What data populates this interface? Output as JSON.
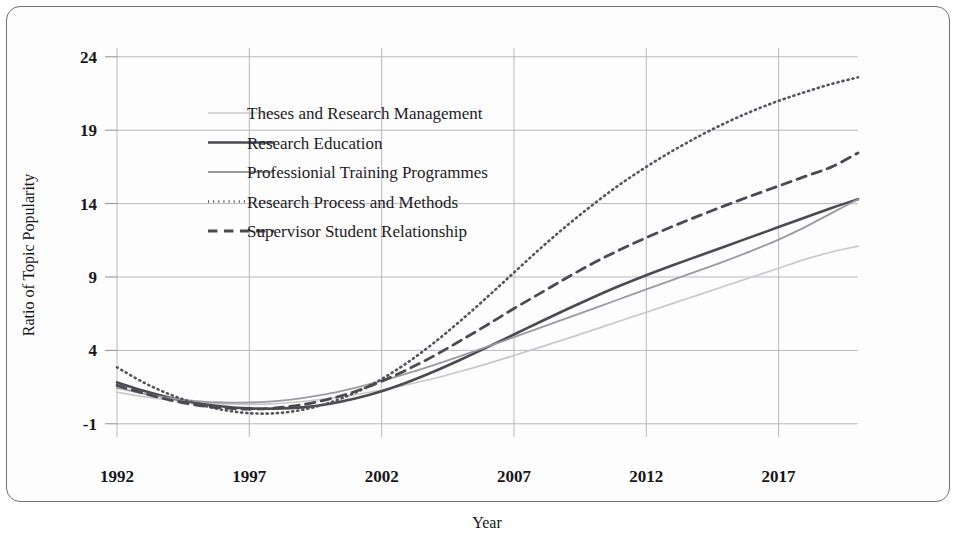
{
  "figure": {
    "frame_border_color": "#6f6f72",
    "background_color": "#fdfdfd",
    "grid_color": "#b9b9bd"
  },
  "chart_data": {
    "type": "line",
    "title": "",
    "subtitle": "",
    "xlabel": "Year",
    "ylabel": "Ratio of Topic Popularity",
    "xlim": [
      1992,
      2020
    ],
    "ylim": [
      -1.9,
      24.6
    ],
    "xticks": [
      1992,
      1997,
      2002,
      2007,
      2012,
      2017
    ],
    "xtick_labels": [
      "1992",
      "1997",
      "2002",
      "2007",
      "2012",
      "2017"
    ],
    "yticks": [
      -1,
      4,
      9,
      14,
      19,
      24
    ],
    "ytick_labels": [
      "-1",
      "4",
      "9",
      "14",
      "19",
      "24"
    ],
    "grid": true,
    "legend_position": "upper-left-inside",
    "x": [
      1992,
      1993,
      1994,
      1995,
      1996,
      1997,
      1998,
      1999,
      2000,
      2001,
      2002,
      2003,
      2004,
      2005,
      2006,
      2007,
      2008,
      2009,
      2010,
      2011,
      2012,
      2013,
      2014,
      2015,
      2016,
      2017,
      2018,
      2019,
      2020
    ],
    "series": [
      {
        "name": "Theses and Research Management",
        "style": "solid",
        "color": "#c9c9cd",
        "width": 1.7,
        "values": [
          1.15,
          0.85,
          0.62,
          0.45,
          0.35,
          0.32,
          0.38,
          0.52,
          0.72,
          0.98,
          1.3,
          1.68,
          2.1,
          2.58,
          3.1,
          3.65,
          4.22,
          4.8,
          5.4,
          6.0,
          6.6,
          7.2,
          7.8,
          8.4,
          9.0,
          9.6,
          10.2,
          10.7,
          11.1
        ]
      },
      {
        "name": "Research Education",
        "style": "solid",
        "color": "#4a4a50",
        "width": 2.6,
        "values": [
          1.82,
          1.25,
          0.78,
          0.42,
          0.18,
          0.05,
          0.03,
          0.12,
          0.35,
          0.72,
          1.22,
          1.85,
          2.58,
          3.38,
          4.22,
          5.08,
          5.95,
          6.8,
          7.62,
          8.4,
          9.12,
          9.8,
          10.45,
          11.1,
          11.75,
          12.4,
          13.05,
          13.7,
          14.3
        ]
      },
      {
        "name": "Professionial Training Programmes",
        "style": "solid",
        "color": "#9a9aa0",
        "width": 1.8,
        "values": [
          1.45,
          1.05,
          0.75,
          0.55,
          0.45,
          0.45,
          0.55,
          0.75,
          1.05,
          1.45,
          1.92,
          2.45,
          3.02,
          3.62,
          4.25,
          4.9,
          5.55,
          6.2,
          6.85,
          7.5,
          8.15,
          8.8,
          9.45,
          10.1,
          10.8,
          11.55,
          12.4,
          13.35,
          14.3
        ]
      },
      {
        "name": "Research Process and Methods",
        "style": "dotted",
        "color": "#55555b",
        "width": 2.6,
        "values": [
          2.85,
          1.82,
          1.0,
          0.38,
          -0.05,
          -0.28,
          -0.28,
          -0.05,
          0.42,
          1.12,
          2.05,
          3.2,
          4.55,
          6.05,
          7.65,
          9.3,
          10.95,
          12.5,
          13.95,
          15.3,
          16.5,
          17.6,
          18.6,
          19.5,
          20.3,
          21.0,
          21.6,
          22.15,
          22.6
        ]
      },
      {
        "name": "Supervisor Student Relationship",
        "style": "dashed",
        "color": "#4a4a50",
        "width": 2.8,
        "values": [
          1.62,
          1.08,
          0.62,
          0.28,
          0.08,
          0.0,
          0.08,
          0.3,
          0.68,
          1.2,
          1.9,
          2.72,
          3.65,
          4.68,
          5.75,
          6.85,
          7.9,
          8.95,
          9.95,
          10.85,
          11.68,
          12.45,
          13.18,
          13.88,
          14.55,
          15.2,
          15.85,
          16.5,
          17.45
        ]
      }
    ]
  }
}
